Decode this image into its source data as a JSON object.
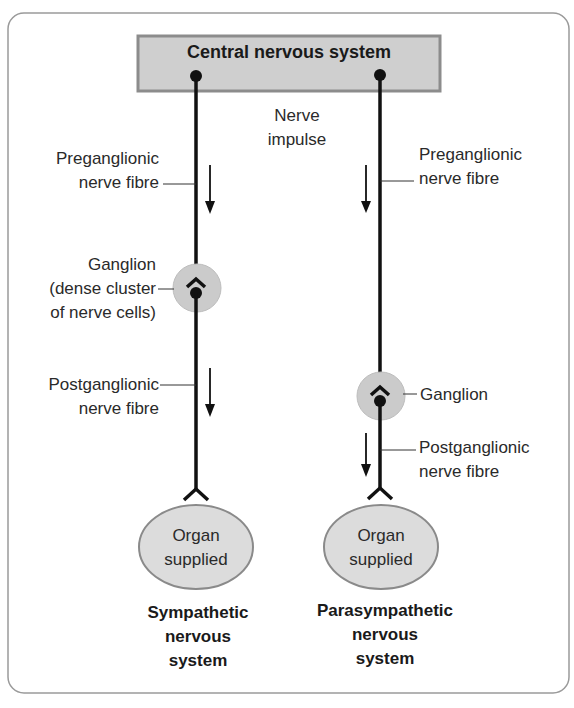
{
  "diagram": {
    "cns_box": {
      "label": "Central nervous system"
    },
    "nerve_impulse": {
      "line1": "Nerve",
      "line2": "impulse"
    },
    "sympathetic": {
      "preganglionic": {
        "line1": "Preganglionic",
        "line2": "nerve fibre"
      },
      "ganglion": {
        "line1": "Ganglion",
        "line2": "(dense cluster",
        "line3": "of nerve cells)"
      },
      "postganglionic": {
        "line1": "Postganglionic",
        "line2": "nerve fibre"
      },
      "organ": {
        "line1": "Organ",
        "line2": "supplied"
      },
      "system_label": {
        "line1": "Sympathetic",
        "line2": "nervous",
        "line3": "system"
      }
    },
    "parasympathetic": {
      "preganglionic": {
        "line1": "Preganglionic",
        "line2": "nerve fibre"
      },
      "ganglion": {
        "line1": "Ganglion"
      },
      "postganglionic": {
        "line1": "Postganglionic",
        "line2": "nerve fibre"
      },
      "organ": {
        "line1": "Organ",
        "line2": "supplied"
      },
      "system_label": {
        "line1": "Parasympathetic",
        "line2": "nervous",
        "line3": "system"
      }
    },
    "colors": {
      "box_fill": "#cfcfcf",
      "box_border": "#8c8c8c",
      "ganglion_fill": "#cbcbcb",
      "organ_fill": "#dcdcdc",
      "organ_border": "#8a8a8a",
      "line": "#111111",
      "frame": "#9a9a9a"
    }
  }
}
